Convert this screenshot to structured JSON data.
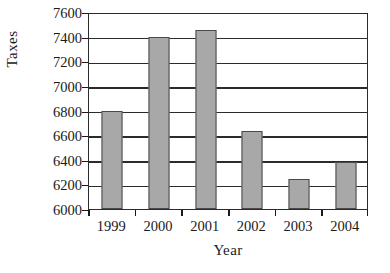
{
  "chart_data": {
    "type": "bar",
    "title": "",
    "xlabel": "Year",
    "ylabel": "Taxes",
    "categories": [
      "1999",
      "2000",
      "2001",
      "2002",
      "2003",
      "2004"
    ],
    "values": [
      6800,
      7400,
      7450,
      6630,
      6240,
      6380
    ],
    "series": [
      {
        "name": "Taxes",
        "values": [
          6800,
          7400,
          7450,
          6630,
          6240,
          6380
        ]
      }
    ],
    "ylim": [
      6000,
      7600
    ],
    "ytick_step": 200,
    "yticks": [
      6000,
      6200,
      6400,
      6600,
      6800,
      7000,
      7200,
      7400,
      7600
    ],
    "ytick_labels": [
      "6000",
      "6200",
      "6400",
      "6600",
      "6800",
      "7000",
      "7200",
      "7400",
      "7600"
    ],
    "grid": true,
    "grid_axis": "y",
    "legend": false,
    "legend_position": "none",
    "colors": {
      "bar_fill": "#a8a8a8",
      "bar_border": "#4a4a4a",
      "axis": "#2b2b2b",
      "gridline": "#2b2b2b",
      "text": "#1a1a1a",
      "background": "#ffffff"
    }
  }
}
